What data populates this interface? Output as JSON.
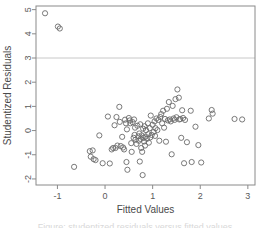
{
  "figure": {
    "background_color": "#ffffff",
    "frame_color": "#8a8a8a",
    "point_color": "#6b6b6b",
    "reference_line_color": "#c8c8c8",
    "tick_color": "#8a8a8a",
    "text_color": "#555555"
  },
  "caption": {
    "text": "Figure: studentized residuals versus fitted values"
  },
  "chart_data": {
    "type": "scatter",
    "title": "",
    "xlabel": "Fitted Values",
    "ylabel": "Studentized Residuals",
    "xlim": [
      -1.45,
      3.15
    ],
    "ylim": [
      -2.25,
      5.15
    ],
    "xticks": [
      -1,
      0,
      1,
      2,
      3
    ],
    "xtick_labels": [
      "-1",
      "0",
      "1",
      "2",
      "3"
    ],
    "yticks": [
      -2,
      -1,
      0,
      1,
      2,
      3,
      4,
      5
    ],
    "ytick_labels": [
      "-2",
      "-1",
      "0",
      "1",
      "2",
      "3",
      "4",
      "5"
    ],
    "grid": false,
    "legend": "none",
    "marker": "open-circle",
    "marker_radius": 2.6,
    "annotations": [
      {
        "type": "hline",
        "y": 3,
        "label": "outlier cutoff at 3",
        "color": "#c8c8c8"
      }
    ],
    "series": [
      {
        "name": "residuals",
        "points": [
          [
            -1.26,
            4.85
          ],
          [
            -0.99,
            4.3
          ],
          [
            -0.95,
            4.22
          ],
          [
            -0.65,
            -1.5
          ],
          [
            -0.32,
            -0.85
          ],
          [
            -0.3,
            -1.08
          ],
          [
            -0.26,
            -0.82
          ],
          [
            -0.24,
            -1.18
          ],
          [
            -0.2,
            -1.22
          ],
          [
            -0.12,
            -0.2
          ],
          [
            -0.05,
            -1.35
          ],
          [
            0.06,
            0.58
          ],
          [
            0.1,
            -1.36
          ],
          [
            0.14,
            -0.78
          ],
          [
            0.17,
            -0.72
          ],
          [
            0.2,
            0.22
          ],
          [
            0.22,
            -0.72
          ],
          [
            0.24,
            0.56
          ],
          [
            0.26,
            -0.62
          ],
          [
            0.3,
            0.98
          ],
          [
            0.31,
            0.36
          ],
          [
            0.33,
            -0.64
          ],
          [
            0.36,
            -0.26
          ],
          [
            0.38,
            -0.7
          ],
          [
            0.4,
            -0.78
          ],
          [
            0.42,
            0.45
          ],
          [
            0.44,
            0.3
          ],
          [
            0.45,
            -1.3
          ],
          [
            0.46,
            0.05
          ],
          [
            0.47,
            -1.62
          ],
          [
            0.5,
            0.52
          ],
          [
            0.52,
            0.42
          ],
          [
            0.53,
            0.3
          ],
          [
            0.55,
            -0.52
          ],
          [
            0.56,
            -0.88
          ],
          [
            0.58,
            0.35
          ],
          [
            0.6,
            -0.3
          ],
          [
            0.61,
            0.46
          ],
          [
            0.62,
            -0.18
          ],
          [
            0.63,
            0.12
          ],
          [
            0.64,
            -0.38
          ],
          [
            0.66,
            -0.55
          ],
          [
            0.68,
            0.2
          ],
          [
            0.7,
            -0.24
          ],
          [
            0.71,
            -0.42
          ],
          [
            0.72,
            -0.12
          ],
          [
            0.73,
            -1.28
          ],
          [
            0.74,
            0.26
          ],
          [
            0.75,
            -0.35
          ],
          [
            0.76,
            -0.72
          ],
          [
            0.77,
            -0.2
          ],
          [
            0.78,
            -0.88
          ],
          [
            0.79,
            -1.84
          ],
          [
            0.8,
            0.08
          ],
          [
            0.81,
            -0.3
          ],
          [
            0.82,
            -0.45
          ],
          [
            0.83,
            0.18
          ],
          [
            0.84,
            -0.62
          ],
          [
            0.85,
            -0.25
          ],
          [
            0.86,
            0.02
          ],
          [
            0.88,
            -0.34
          ],
          [
            0.9,
            0.3
          ],
          [
            0.91,
            -0.15
          ],
          [
            0.92,
            -0.5
          ],
          [
            0.94,
            0.1
          ],
          [
            0.95,
            -0.28
          ],
          [
            0.96,
            0.62
          ],
          [
            0.98,
            -0.18
          ],
          [
            1.0,
            0.24
          ],
          [
            1.02,
            -0.06
          ],
          [
            1.04,
            0.38
          ],
          [
            1.05,
            -0.22
          ],
          [
            1.06,
            0.1
          ],
          [
            1.08,
            0.5
          ],
          [
            1.1,
            0.02
          ],
          [
            1.12,
            0.44
          ],
          [
            1.14,
            -0.42
          ],
          [
            1.16,
            0.56
          ],
          [
            1.18,
            0.68
          ],
          [
            1.2,
            0.3
          ],
          [
            1.22,
            0.82
          ],
          [
            1.24,
            0.12
          ],
          [
            1.26,
            0.48
          ],
          [
            1.28,
            -0.46
          ],
          [
            1.3,
            0.9
          ],
          [
            1.32,
            0.42
          ],
          [
            1.34,
            1.18
          ],
          [
            1.36,
            0.46
          ],
          [
            1.38,
            0.38
          ],
          [
            1.4,
            -0.98
          ],
          [
            1.42,
            1.02
          ],
          [
            1.44,
            0.5
          ],
          [
            1.46,
            0.44
          ],
          [
            1.48,
            1.3
          ],
          [
            1.5,
            0.55
          ],
          [
            1.52,
            1.7
          ],
          [
            1.55,
            1.36
          ],
          [
            1.56,
            0.46
          ],
          [
            1.58,
            0.48
          ],
          [
            1.6,
            -0.3
          ],
          [
            1.62,
            0.84
          ],
          [
            1.64,
            0.52
          ],
          [
            1.66,
            -1.35
          ],
          [
            1.68,
            0.44
          ],
          [
            1.72,
            -0.48
          ],
          [
            1.8,
            0.82
          ],
          [
            1.82,
            -1.3
          ],
          [
            1.9,
            0.16
          ],
          [
            1.96,
            -0.6
          ],
          [
            2.02,
            -1.32
          ],
          [
            2.18,
            0.5
          ],
          [
            2.24,
            0.85
          ],
          [
            2.26,
            0.7
          ],
          [
            2.72,
            0.48
          ],
          [
            2.88,
            0.46
          ]
        ]
      }
    ]
  }
}
